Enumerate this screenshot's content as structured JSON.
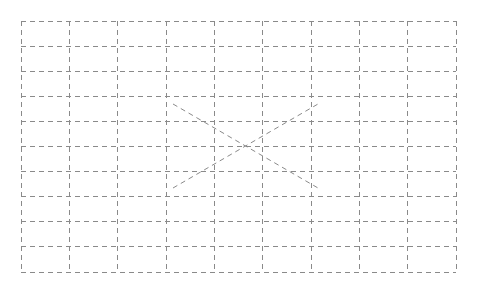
{
  "page": {
    "background_color": "#ffffff",
    "width": 478,
    "height": 292
  },
  "diagram": {
    "name": "dashed-grid-with-x",
    "stroke_color": "#8a8a8a",
    "stroke_width": 1,
    "dash_pattern": "5,4",
    "grid": {
      "origin_x": 21,
      "origin_y": 21,
      "cell_width": 48.33,
      "cell_height": 25.1,
      "columns": 9,
      "rows": 10,
      "right_edge": 456,
      "bottom_edge": 272,
      "vertical_line_x": [
        21,
        69.3,
        117.7,
        166,
        214.3,
        262.7,
        311,
        359.3,
        407.7,
        456
      ],
      "horizontal_line_y": [
        21,
        46.1,
        71.2,
        96.3,
        121.4,
        146.5,
        171.6,
        196.7,
        221.8,
        246.9,
        272
      ]
    },
    "diagonals": [
      {
        "name": "diagonal-down-right",
        "x1": 173,
        "y1": 104,
        "x2": 318,
        "y2": 188
      },
      {
        "name": "diagonal-up-right",
        "x1": 173,
        "y1": 188,
        "x2": 318,
        "y2": 104
      }
    ],
    "crossing_point": {
      "x": 245.5,
      "y": 146
    }
  }
}
